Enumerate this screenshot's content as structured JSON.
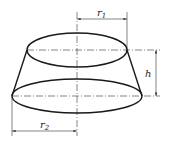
{
  "diagram": {
    "type": "frustum-of-cone",
    "labels": {
      "top_radius": "r",
      "top_radius_sub": "1",
      "bottom_radius": "r",
      "bottom_radius_sub": "2",
      "height": "h"
    },
    "colors": {
      "line": "#1a1a1a",
      "background": "#ffffff"
    }
  }
}
